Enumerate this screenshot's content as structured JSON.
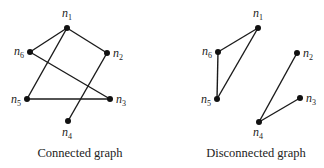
{
  "graphs": [
    {
      "caption": "Connected graph",
      "nodes": [
        {
          "id": "n1",
          "label": "n",
          "sub": "1",
          "x": 67,
          "y": 28,
          "lx": 62,
          "ly": 17,
          "anchor": "start"
        },
        {
          "id": "n2",
          "label": "n",
          "sub": "2",
          "x": 107,
          "y": 53,
          "lx": 113,
          "ly": 57,
          "anchor": "start"
        },
        {
          "id": "n3",
          "label": "n",
          "sub": "3",
          "x": 110,
          "y": 99,
          "lx": 116,
          "ly": 103,
          "anchor": "start"
        },
        {
          "id": "n4",
          "label": "n",
          "sub": "4",
          "x": 68,
          "y": 121,
          "lx": 62,
          "ly": 136,
          "anchor": "start"
        },
        {
          "id": "n5",
          "label": "n",
          "sub": "5",
          "x": 27,
          "y": 99,
          "lx": 21,
          "ly": 103,
          "anchor": "end"
        },
        {
          "id": "n6",
          "label": "n",
          "sub": "6",
          "x": 30,
          "y": 52,
          "lx": 24,
          "ly": 55,
          "anchor": "end"
        }
      ],
      "edges": [
        [
          "n1",
          "n6"
        ],
        [
          "n1",
          "n2"
        ],
        [
          "n1",
          "n5"
        ],
        [
          "n6",
          "n3"
        ],
        [
          "n5",
          "n3"
        ],
        [
          "n2",
          "n4"
        ]
      ],
      "caption_x": 0
    },
    {
      "caption": "Disconnected graph",
      "nodes": [
        {
          "id": "n1",
          "label": "n",
          "sub": "1",
          "x": 258,
          "y": 28,
          "lx": 253,
          "ly": 17,
          "anchor": "start"
        },
        {
          "id": "n2",
          "label": "n",
          "sub": "2",
          "x": 297,
          "y": 53,
          "lx": 303,
          "ly": 57,
          "anchor": "start"
        },
        {
          "id": "n3",
          "label": "n",
          "sub": "3",
          "x": 300,
          "y": 98,
          "lx": 306,
          "ly": 102,
          "anchor": "start"
        },
        {
          "id": "n4",
          "label": "n",
          "sub": "4",
          "x": 259,
          "y": 122,
          "lx": 253,
          "ly": 136,
          "anchor": "start"
        },
        {
          "id": "n5",
          "label": "n",
          "sub": "5",
          "x": 217,
          "y": 99,
          "lx": 211,
          "ly": 103,
          "anchor": "end"
        },
        {
          "id": "n6",
          "label": "n",
          "sub": "6",
          "x": 218,
          "y": 52,
          "lx": 212,
          "ly": 55,
          "anchor": "end"
        }
      ],
      "edges": [
        [
          "n1",
          "n6"
        ],
        [
          "n1",
          "n5"
        ],
        [
          "n6",
          "n5"
        ],
        [
          "n4",
          "n2"
        ],
        [
          "n4",
          "n3"
        ]
      ],
      "caption_x": 176
    }
  ]
}
